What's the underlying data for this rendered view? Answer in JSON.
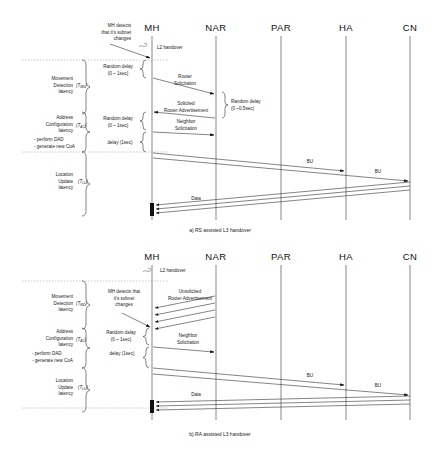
{
  "figure": {
    "title_a": "a)  RS assisted L3 handover",
    "title_b": "b)  RA assisted L3 handover"
  },
  "nodes": [
    {
      "id": "mh",
      "label": "MH",
      "x": 152
    },
    {
      "id": "nar",
      "label": "NAR",
      "x": 216
    },
    {
      "id": "par",
      "label": "PAR",
      "x": 281
    },
    {
      "id": "ha",
      "label": "HA",
      "x": 346
    },
    {
      "id": "cn",
      "label": "CN",
      "x": 410
    }
  ],
  "diagram_a": {
    "caption": "a)  RS assisted L3 handover",
    "annotations": {
      "mh_detects_l1": "MH detects",
      "mh_detects_l2": "that it's subnet",
      "mh_detects_l3": "changes",
      "l2_handover": "L2 handover"
    },
    "phases": [
      {
        "name": "movement-detection",
        "line1": "Movement",
        "line2": "Detection",
        "line3": "latency",
        "symbol": "T",
        "subscript": "MD"
      },
      {
        "name": "address-configuration",
        "line1": "Address",
        "line2": "Configuration",
        "line3": "latency",
        "symbol": "T",
        "subscript": "AC",
        "bullets": [
          "- perform DAD",
          "- generate new CoA"
        ]
      },
      {
        "name": "location-update",
        "line1": "Location",
        "line2": "Update",
        "line3": "latency",
        "symbol": "T",
        "subscript": "LU"
      }
    ],
    "delays": [
      {
        "name": "random-delay-1",
        "line1": "Random delay",
        "line2": "(0 ~ 1sec)"
      },
      {
        "name": "random-delay-2",
        "line1": "Random delay",
        "line2": "(0 ~ 1sec)"
      },
      {
        "name": "dad-delay",
        "line1": "delay (1sec)",
        "line2": ""
      },
      {
        "name": "nar-random-delay",
        "line1": "Random delay",
        "line2": "(0 ~0.5sec)"
      }
    ],
    "messages": [
      {
        "name": "router-solicitation",
        "line1": "Router",
        "line2": "Solicitation",
        "from": "mh",
        "to": "nar"
      },
      {
        "name": "router-advertisement",
        "line1": "Solicited",
        "line2": "Router Advertisement",
        "from": "nar",
        "to": "mh"
      },
      {
        "name": "neighbor-solicitation",
        "line1": "Neighbor",
        "line2": "Solicitation",
        "from": "mh",
        "to": "nar"
      },
      {
        "name": "bu-to-ha",
        "line1": "BU",
        "line2": "",
        "from": "mh",
        "to": "ha"
      },
      {
        "name": "bu-to-cn",
        "line1": "BU",
        "line2": "",
        "from": "mh",
        "to": "cn"
      },
      {
        "name": "data-flow",
        "line1": "Data",
        "line2": "",
        "from": "cn",
        "to": "mh"
      }
    ]
  },
  "diagram_b": {
    "caption": "b)  RA assisted L3 handover",
    "annotations": {
      "mh_detects_l1": "MH detects that",
      "mh_detects_l2": "it's subnet",
      "mh_detects_l3": "changes",
      "l2_handover": "L2 handover"
    },
    "phases": [
      {
        "name": "movement-detection",
        "line1": "Movement",
        "line2": "Detection",
        "line3": "latency",
        "symbol": "T",
        "subscript": "MD"
      },
      {
        "name": "address-configuration",
        "line1": "Address",
        "line2": "Configuration",
        "line3": "latency",
        "symbol": "T",
        "subscript": "AC",
        "bullets": [
          "- perform DAD",
          "- generate new CoA"
        ]
      },
      {
        "name": "location-update",
        "line1": "Location",
        "line2": "Update",
        "line3": "latency",
        "symbol": "T",
        "subscript": "LU"
      }
    ],
    "delays": [
      {
        "name": "random-delay-1",
        "line1": "Random delay",
        "line2": "(0 ~ 1sec)"
      },
      {
        "name": "dad-delay",
        "line1": "delay (1sec)",
        "line2": ""
      }
    ],
    "messages": [
      {
        "name": "unsolicited-router-advertisement",
        "line1": "Unsolicited",
        "line2": "Router Advertisement",
        "from": "nar",
        "to": "mh",
        "count": 4
      },
      {
        "name": "neighbor-solicitation",
        "line1": "Neighbor",
        "line2": "Solicitation",
        "from": "mh",
        "to": "nar"
      },
      {
        "name": "bu-to-ha",
        "line1": "BU",
        "line2": "",
        "from": "mh",
        "to": "ha"
      },
      {
        "name": "bu-to-cn",
        "line1": "BU",
        "line2": "",
        "from": "mh",
        "to": "cn"
      },
      {
        "name": "data-flow",
        "line1": "Data",
        "line2": "",
        "from": "cn",
        "to": "mh"
      }
    ]
  },
  "colors": {
    "line": "#333333",
    "lifeline": "#555555",
    "text": "#1a1a1a",
    "background": "#ffffff"
  }
}
